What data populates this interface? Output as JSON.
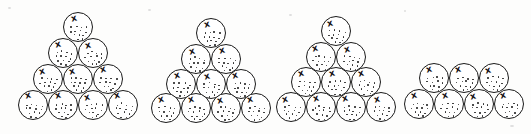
{
  "figure": {
    "canvas_width": 531,
    "canvas_height": 134,
    "background_color": "#fdfdfc",
    "ball_stroke_color": "#1a1a1a",
    "ball_fill_color": "#ffffff",
    "speck_color": "#2b2b2b",
    "mark_color": "#111111",
    "ball_diameter": 30,
    "column_pitch": 30,
    "row_pitch": 26,
    "mark_glyph": "x",
    "total_balls": 37
  },
  "groups": [
    {
      "name": "group-1",
      "label": "Triangular stack of 10",
      "shape": "triangle",
      "ball_count": 10,
      "rows": [
        1,
        2,
        3,
        4
      ],
      "origin_x": 22,
      "origin_y": 12,
      "balls": [
        {
          "row": 0,
          "col": 0,
          "x": 63,
          "y": 12
        },
        {
          "row": 1,
          "col": 0,
          "x": 48,
          "y": 38
        },
        {
          "row": 1,
          "col": 1,
          "x": 78,
          "y": 38
        },
        {
          "row": 2,
          "col": 0,
          "x": 33,
          "y": 64
        },
        {
          "row": 2,
          "col": 1,
          "x": 63,
          "y": 64
        },
        {
          "row": 2,
          "col": 2,
          "x": 93,
          "y": 64
        },
        {
          "row": 3,
          "col": 0,
          "x": 18,
          "y": 90
        },
        {
          "row": 3,
          "col": 1,
          "x": 48,
          "y": 90
        },
        {
          "row": 3,
          "col": 2,
          "x": 78,
          "y": 90
        },
        {
          "row": 3,
          "col": 3,
          "x": 108,
          "y": 90
        }
      ]
    },
    {
      "name": "group-2",
      "label": "Triangular stack of 10",
      "shape": "triangle",
      "ball_count": 10,
      "rows": [
        1,
        2,
        3,
        4
      ],
      "origin_x": 152,
      "origin_y": 18,
      "balls": [
        {
          "row": 0,
          "col": 0,
          "x": 196,
          "y": 18
        },
        {
          "row": 1,
          "col": 0,
          "x": 181,
          "y": 44
        },
        {
          "row": 1,
          "col": 1,
          "x": 211,
          "y": 44
        },
        {
          "row": 2,
          "col": 0,
          "x": 166,
          "y": 69
        },
        {
          "row": 2,
          "col": 1,
          "x": 196,
          "y": 69
        },
        {
          "row": 2,
          "col": 2,
          "x": 226,
          "y": 69
        },
        {
          "row": 3,
          "col": 0,
          "x": 151,
          "y": 93
        },
        {
          "row": 3,
          "col": 1,
          "x": 181,
          "y": 93
        },
        {
          "row": 3,
          "col": 2,
          "x": 211,
          "y": 93
        },
        {
          "row": 3,
          "col": 3,
          "x": 241,
          "y": 93
        }
      ]
    },
    {
      "name": "group-3",
      "label": "Triangular stack of 10",
      "shape": "triangle",
      "ball_count": 10,
      "rows": [
        1,
        2,
        3,
        4
      ],
      "origin_x": 277,
      "origin_y": 16,
      "balls": [
        {
          "row": 0,
          "col": 0,
          "x": 321,
          "y": 16
        },
        {
          "row": 1,
          "col": 0,
          "x": 306,
          "y": 42
        },
        {
          "row": 1,
          "col": 1,
          "x": 336,
          "y": 42
        },
        {
          "row": 2,
          "col": 0,
          "x": 291,
          "y": 67
        },
        {
          "row": 2,
          "col": 1,
          "x": 321,
          "y": 67
        },
        {
          "row": 2,
          "col": 2,
          "x": 351,
          "y": 67
        },
        {
          "row": 3,
          "col": 0,
          "x": 276,
          "y": 92
        },
        {
          "row": 3,
          "col": 1,
          "x": 306,
          "y": 92
        },
        {
          "row": 3,
          "col": 2,
          "x": 336,
          "y": 92
        },
        {
          "row": 3,
          "col": 3,
          "x": 366,
          "y": 92
        }
      ]
    },
    {
      "name": "group-4",
      "label": "Trapezoid stack of 7",
      "shape": "trapezoid",
      "ball_count": 7,
      "rows": [
        3,
        4
      ],
      "origin_x": 404,
      "origin_y": 63,
      "balls": [
        {
          "row": 0,
          "col": 0,
          "x": 419,
          "y": 63
        },
        {
          "row": 0,
          "col": 1,
          "x": 449,
          "y": 63
        },
        {
          "row": 0,
          "col": 2,
          "x": 479,
          "y": 63
        },
        {
          "row": 1,
          "col": 0,
          "x": 404,
          "y": 89
        },
        {
          "row": 1,
          "col": 1,
          "x": 434,
          "y": 89
        },
        {
          "row": 1,
          "col": 2,
          "x": 464,
          "y": 89
        },
        {
          "row": 1,
          "col": 3,
          "x": 494,
          "y": 89
        }
      ]
    }
  ],
  "texture": {
    "speck_pattern": [
      {
        "x": 7,
        "y": 13
      },
      {
        "x": 12,
        "y": 12
      },
      {
        "x": 17,
        "y": 13
      },
      {
        "x": 22,
        "y": 14
      },
      {
        "x": 6,
        "y": 17
      },
      {
        "x": 11,
        "y": 17
      },
      {
        "x": 16,
        "y": 17
      },
      {
        "x": 21,
        "y": 18
      },
      {
        "x": 9,
        "y": 21
      },
      {
        "x": 14,
        "y": 21
      },
      {
        "x": 19,
        "y": 22
      },
      {
        "x": 12,
        "y": 25
      },
      {
        "x": 17,
        "y": 25
      }
    ]
  },
  "noise_marks": [
    {
      "x": 8,
      "y": 7,
      "w": 3,
      "h": 2
    },
    {
      "x": 148,
      "y": 9,
      "w": 3,
      "h": 2
    },
    {
      "x": 289,
      "y": 14,
      "w": 3,
      "h": 2
    },
    {
      "x": 404,
      "y": 10,
      "w": 2,
      "h": 2
    },
    {
      "x": 510,
      "y": 125,
      "w": 4,
      "h": 2
    }
  ]
}
